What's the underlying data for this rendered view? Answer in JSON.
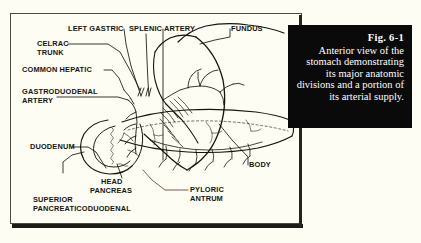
{
  "figure": {
    "caption_title": "Fig. 6-1",
    "caption_body": "Anterior view of the stomach demonstrating its major anatomic divisions and a portion of its arterial supply.",
    "background_color": "#fdfdf3",
    "caption_background_color": "#0a0a0a",
    "caption_text_color": "#ffffff",
    "frame_border_color": "#4a4a42",
    "line_color": "#151510"
  },
  "labels": [
    {
      "id": "left-gastric",
      "text": "LEFT GASTRIC"
    },
    {
      "id": "splenic-artery",
      "text": "SPLENIC ARTERY"
    },
    {
      "id": "fundus",
      "text": "FUNDUS"
    },
    {
      "id": "celrac-trunk-line1",
      "text": "CELRAC"
    },
    {
      "id": "celrac-trunk-line2",
      "text": "TRUNK"
    },
    {
      "id": "common-hepatic",
      "text": "COMMON HEPATIC"
    },
    {
      "id": "gastroduodenal-line1",
      "text": "GASTRODUODENAL"
    },
    {
      "id": "gastroduodenal-line2",
      "text": "ARTERY"
    },
    {
      "id": "body",
      "text": "BODY"
    },
    {
      "id": "duodenum",
      "text": "DUODENUM"
    },
    {
      "id": "head-pancreas-line1",
      "text": "HEAD"
    },
    {
      "id": "head-pancreas-line2",
      "text": "PANCREAS"
    },
    {
      "id": "pyloric-antrum-line1",
      "text": "PYLORIC"
    },
    {
      "id": "pyloric-antrum-line2",
      "text": "ANTRUM"
    },
    {
      "id": "sup-pancreaticoduodenal-line1",
      "text": "SUPERIOR"
    },
    {
      "id": "sup-pancreaticoduodenal-line2",
      "text": "PANCREATICODUODENAL"
    }
  ]
}
